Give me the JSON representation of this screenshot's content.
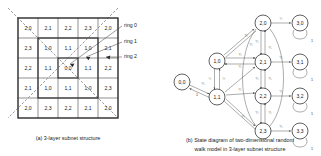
{
  "figure": {
    "panel_a": {
      "caption": "(a) 3-layer subnet structure",
      "grid": {
        "rows": 5,
        "cols": 5,
        "cells": [
          [
            "2,0",
            "2,1",
            "2,2",
            "2,3",
            "2,0"
          ],
          [
            "2,3",
            "1,0",
            "1,1",
            "1,0",
            "2,1"
          ],
          [
            "2,2",
            "1,1",
            "0,0",
            "1,1",
            "2,2"
          ],
          [
            "2,1",
            "1,0",
            "1,1",
            "1,0",
            "2,3"
          ],
          [
            "2,0",
            "2,3",
            "2,2",
            "2,1",
            "2,0"
          ]
        ]
      },
      "ring_labels": [
        "ring 0",
        "ring 1",
        "ring 2"
      ]
    },
    "panel_b": {
      "caption_line1": "(b) State diagram of two-dimensional random",
      "caption_line2": "walk model in 3-layer subnet structure",
      "nodes": [
        {
          "id": "0,0",
          "label": "0,0",
          "x": 22,
          "y": 82
        },
        {
          "id": "1,0",
          "label": "1,0",
          "x": 57,
          "y": 61
        },
        {
          "id": "1,1",
          "label": "1,1",
          "x": 57,
          "y": 97
        },
        {
          "id": "2,0",
          "label": "2,0",
          "x": 103,
          "y": 23
        },
        {
          "id": "2,1",
          "label": "2,1",
          "x": 103,
          "y": 62
        },
        {
          "id": "2,2",
          "label": "2,2",
          "x": 103,
          "y": 96
        },
        {
          "id": "2,3",
          "label": "2,3",
          "x": 103,
          "y": 131
        },
        {
          "id": "3,0",
          "label": "3,0",
          "x": 140,
          "y": 23
        },
        {
          "id": "3,1",
          "label": "3,1",
          "x": 140,
          "y": 62
        },
        {
          "id": "3,2",
          "label": "3,2",
          "x": 140,
          "y": 96
        },
        {
          "id": "3,3",
          "label": "3,3",
          "x": 140,
          "y": 131
        }
      ],
      "edge_labels": {
        "one": "1",
        "half": "½",
        "quarter": "¼",
        "self_loop": "1"
      },
      "absorbing_self_loop_labels": [
        "1",
        "1",
        "1",
        "1"
      ]
    }
  }
}
